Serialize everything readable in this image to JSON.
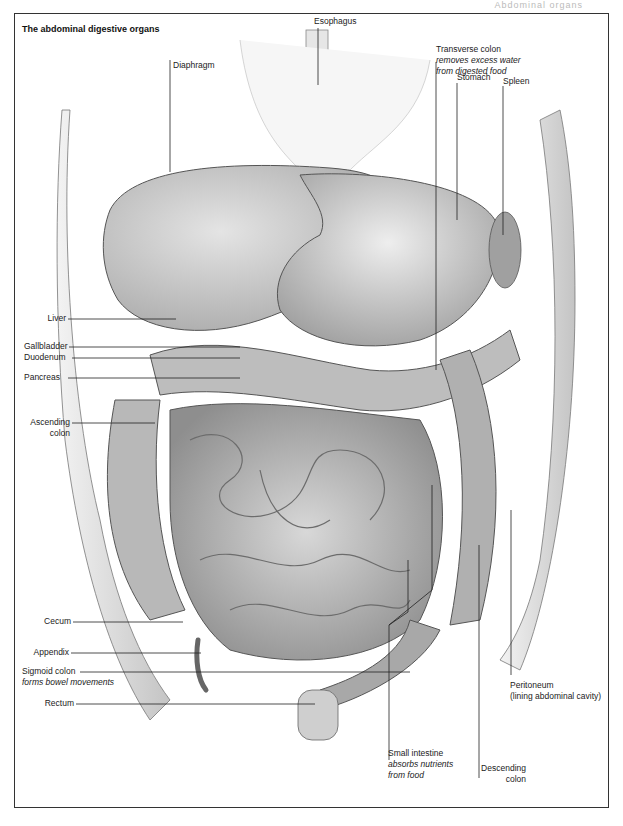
{
  "page_header": "Abdominal organs",
  "figure": {
    "title": "The abdominal digestive organs",
    "labels": {
      "esophagus": {
        "name": "Esophagus"
      },
      "diaphragm": {
        "name": "Diaphragm"
      },
      "transverse_colon": {
        "name": "Transverse colon",
        "note_line1": "removes excess water",
        "note_line2": "from digested food"
      },
      "stomach": {
        "name": "Stomach"
      },
      "spleen": {
        "name": "Spleen"
      },
      "liver": {
        "name": "Liver"
      },
      "gallbladder": {
        "name": "Gallbladder"
      },
      "duodenum": {
        "name": "Duodenum"
      },
      "pancreas": {
        "name": "Pancreas"
      },
      "ascending_colon": {
        "line1": "Ascending",
        "line2": "colon"
      },
      "cecum": {
        "name": "Cecum"
      },
      "appendix": {
        "name": "Appendix"
      },
      "sigmoid_colon": {
        "name": "Sigmoid colon",
        "note": "forms bowel movements"
      },
      "rectum": {
        "name": "Rectum"
      },
      "peritoneum": {
        "name": "Peritoneum",
        "note": "(lining abdominal cavity)"
      },
      "small_intestine": {
        "name": "Small intestine",
        "note_line1": "absorbs nutrients",
        "note_line2": "from food"
      },
      "descending_colon": {
        "line1": "Descending",
        "line2": "colon"
      }
    }
  }
}
